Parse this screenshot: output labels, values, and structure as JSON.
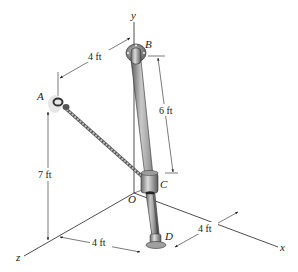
{
  "figure": {
    "points": {
      "A": "A",
      "B": "B",
      "C": "C",
      "D": "D",
      "O": "O"
    },
    "axes": {
      "x": "x",
      "y": "y",
      "z": "z"
    },
    "dimensions": {
      "top_A_to_B": "4 ft",
      "B_to_C": "6 ft",
      "A_height": "7 ft",
      "z_to_D": "4 ft",
      "x_to_D": "4 ft"
    },
    "colors": {
      "pole": "#9a9a9a",
      "pole_dark": "#5a5a5a",
      "cable": "#8a8a8a",
      "lines": "#222222"
    }
  }
}
